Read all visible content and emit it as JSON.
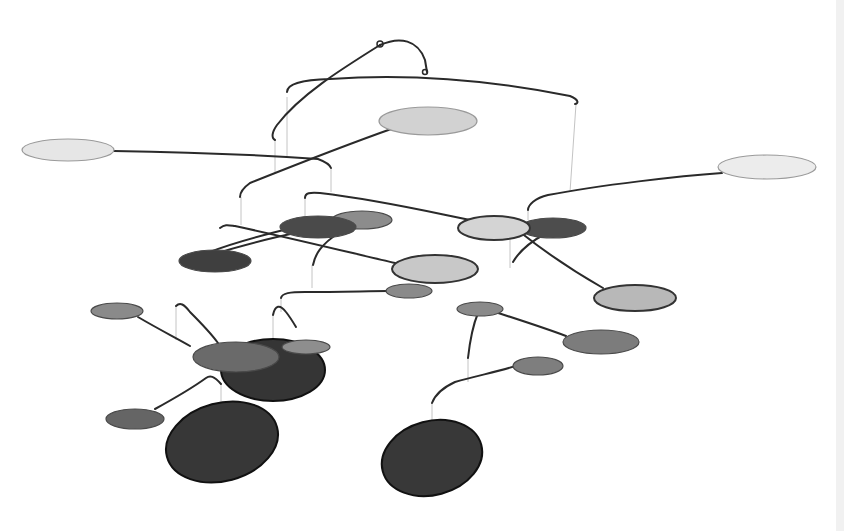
{
  "image": {
    "subject": "hanging mobile sculpture",
    "description": "Grayscale kinetic mobile with wire arms and elliptical discs in light, medium and dark gray",
    "background": "#ffffff",
    "colors": {
      "wire": "#2a2a2a",
      "string": "#bdbdbd",
      "light_disc": "#e4e4e4",
      "light_mid_disc": "#c6c6c6",
      "mid_disc": "#8a8a8a",
      "dark_mid_disc": "#5e5e5e",
      "dark_disc": "#3a3a3a"
    },
    "discs": [
      {
        "cx": 68,
        "cy": 150,
        "rx": 46,
        "ry": 11,
        "fill": "#e6e6e6"
      },
      {
        "cx": 428,
        "cy": 121,
        "rx": 49,
        "ry": 14,
        "fill": "#d2d2d2"
      },
      {
        "cx": 767,
        "cy": 167,
        "rx": 49,
        "ry": 12,
        "fill": "#ececec"
      },
      {
        "cx": 362,
        "cy": 220,
        "rx": 30,
        "ry": 9,
        "fill": "#8c8c8c"
      },
      {
        "cx": 318,
        "cy": 227,
        "rx": 38,
        "ry": 11,
        "fill": "#4a4a4a"
      },
      {
        "cx": 215,
        "cy": 261,
        "rx": 36,
        "ry": 11,
        "fill": "#3f3f3f"
      },
      {
        "cx": 494,
        "cy": 228,
        "rx": 36,
        "ry": 12,
        "fill": "#d4d4d4"
      },
      {
        "cx": 553,
        "cy": 228,
        "rx": 33,
        "ry": 10,
        "fill": "#4d4d4d"
      },
      {
        "cx": 435,
        "cy": 269,
        "rx": 43,
        "ry": 14,
        "fill": "#c8c8c8"
      },
      {
        "cx": 635,
        "cy": 298,
        "rx": 41,
        "ry": 13,
        "fill": "#b8b8b8"
      },
      {
        "cx": 409,
        "cy": 291,
        "rx": 23,
        "ry": 7,
        "fill": "#8a8a8a"
      },
      {
        "cx": 117,
        "cy": 311,
        "rx": 26,
        "ry": 8,
        "fill": "#8a8a8a"
      },
      {
        "cx": 480,
        "cy": 309,
        "rx": 23,
        "ry": 7,
        "fill": "#8a8a8a"
      },
      {
        "cx": 601,
        "cy": 342,
        "rx": 38,
        "ry": 12,
        "fill": "#7c7c7c"
      },
      {
        "cx": 273,
        "cy": 370,
        "rx": 52,
        "ry": 31,
        "fill": "#353535"
      },
      {
        "cx": 236,
        "cy": 357,
        "rx": 43,
        "ry": 15,
        "fill": "#6a6a6a"
      },
      {
        "cx": 306,
        "cy": 347,
        "rx": 24,
        "ry": 7,
        "fill": "#8e8e8e"
      },
      {
        "cx": 538,
        "cy": 366,
        "rx": 25,
        "ry": 9,
        "fill": "#7e7e7e"
      },
      {
        "cx": 135,
        "cy": 419,
        "rx": 29,
        "ry": 10,
        "fill": "#656565"
      },
      {
        "cx": 222,
        "cy": 442,
        "rx": 57,
        "ry": 39,
        "fill": "#373737"
      },
      {
        "cx": 432,
        "cy": 458,
        "rx": 51,
        "ry": 37,
        "fill": "#383838"
      }
    ]
  }
}
